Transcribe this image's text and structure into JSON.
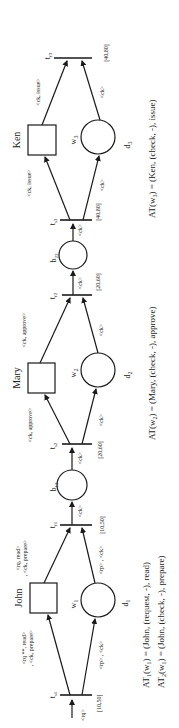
{
  "diagram": {
    "type": "workflow-petri-net",
    "orientation": "rotated-90-ccw",
    "colors": {
      "stroke": "#1a1a1a",
      "background": "#ffffff"
    },
    "actors": [
      {
        "id": "john",
        "label": "John",
        "resource": "w1",
        "resource_label": "w",
        "resource_sub": "1",
        "data_label": "d",
        "data_sub": "1"
      },
      {
        "id": "mary",
        "label": "Mary",
        "resource": "w2",
        "resource_label": "w",
        "resource_sub": "2",
        "data_label": "d",
        "data_sub": "2"
      },
      {
        "id": "ken",
        "label": "Ken",
        "resource": "w3",
        "resource_label": "w",
        "resource_sub": "3",
        "data_label": "d",
        "data_sub": "3"
      }
    ],
    "transitions": [
      {
        "label": "t",
        "sub": "s1",
        "interval": "[10,50]"
      },
      {
        "label": "t",
        "sub": "f1",
        "interval": "[10,50]"
      },
      {
        "label": "t",
        "sub": "s2",
        "interval": "[20,60]"
      },
      {
        "label": "t",
        "sub": "f2",
        "interval": "[20,60]"
      },
      {
        "label": "t",
        "sub": "s3",
        "interval": "[40,80]"
      },
      {
        "label": "t",
        "sub": "f3",
        "interval": "[40,80]"
      }
    ],
    "buffers": [
      {
        "label": "b",
        "sub": "12"
      },
      {
        "label": "b",
        "sub": "23"
      }
    ],
    "arc_labels": {
      "input_rq": "<rq>",
      "john_in_1": "<rq **, read>",
      "john_in_2": ", <ck, prepare>",
      "john_out_1": "<rq, read>",
      "john_out_2": ", <ck, prepare>",
      "d1_in": "<rp> , <ck>",
      "d1_out": "<rp> , <ck>",
      "tf1_out": "<ck>",
      "ts2_in": "<ck>",
      "mary_in": "<ck, approve>",
      "mary_out": "<ck, approve>",
      "d2_in": "<ck>",
      "d2_out": "<ck>",
      "tf2_out": "<ck>",
      "ts3_in": "<ck>",
      "ken_in": "<ck, issue>",
      "ken_out": "<ck, issue>",
      "d3_in": "<ck>",
      "d3_out": "<ck>"
    },
    "assignments": [
      {
        "lhs": "AT",
        "lhs_sub": "1",
        "arg": "w",
        "arg_sub": "1",
        "rhs": " = (John, (request, -), read)"
      },
      {
        "lhs": "AT",
        "lhs_sub": "2",
        "arg": "w",
        "arg_sub": "1",
        "rhs": " = (John, (check, -), prepare)"
      },
      {
        "lhs": "AT",
        "lhs_sub": "",
        "arg": "w",
        "arg_sub": "2",
        "rhs": " = (Mary,  (check, -), approve)"
      },
      {
        "lhs": "AT",
        "lhs_sub": "",
        "arg": "w",
        "arg_sub": "3",
        "rhs": " = (Ken, (check, -), issue)"
      }
    ]
  }
}
